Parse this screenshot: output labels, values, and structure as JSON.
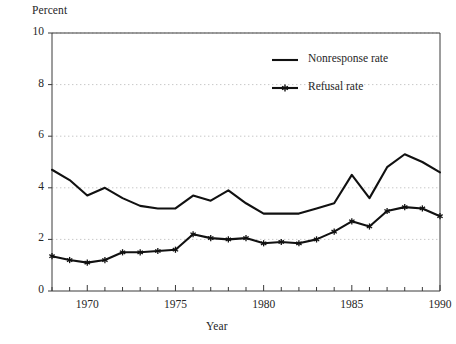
{
  "chart_data": {
    "type": "line",
    "title": "",
    "xlabel": "Year",
    "ylabel": "Percent",
    "ylim": [
      0,
      10
    ],
    "xlim": [
      1968,
      1990
    ],
    "yticks": [
      0,
      2,
      4,
      6,
      8,
      10
    ],
    "ytick_labels": [
      "0",
      "2",
      "4",
      "6",
      "8",
      "10"
    ],
    "xticks": [
      1970,
      1975,
      1980,
      1985,
      1990
    ],
    "xtick_labels": [
      "1970",
      "1975",
      "1980",
      "1985",
      "1990"
    ],
    "minor_xticks_every": 1,
    "grid": "horizontal-dotted",
    "legend_position": "top-center-right",
    "x": [
      1968,
      1969,
      1970,
      1971,
      1972,
      1973,
      1974,
      1975,
      1976,
      1977,
      1978,
      1979,
      1980,
      1981,
      1982,
      1983,
      1984,
      1985,
      1986,
      1987,
      1988,
      1989,
      1990
    ],
    "series": [
      {
        "name": "Nonresponse rate",
        "marker": "none",
        "values": [
          4.7,
          4.3,
          3.7,
          4.0,
          3.6,
          3.3,
          3.2,
          3.2,
          3.7,
          3.5,
          3.9,
          3.4,
          3.0,
          3.0,
          3.0,
          3.2,
          3.4,
          4.5,
          3.6,
          4.8,
          5.3,
          5.0,
          4.6
        ]
      },
      {
        "name": "Refusal rate",
        "marker": "star",
        "values": [
          1.35,
          1.2,
          1.1,
          1.2,
          1.5,
          1.5,
          1.55,
          1.6,
          2.2,
          2.05,
          2.0,
          2.05,
          1.85,
          1.9,
          1.85,
          2.0,
          2.3,
          2.7,
          2.5,
          3.1,
          3.25,
          3.2,
          2.9
        ]
      }
    ]
  },
  "legend": {
    "items": [
      {
        "label": "Nonresponse rate",
        "marker": "plain-line"
      },
      {
        "label": "Refusal rate",
        "marker": "star-line"
      }
    ]
  },
  "colors": {
    "line": "#111111",
    "axis": "#3a3a3a",
    "grid": "#b9b9b9",
    "text": "#262626",
    "background": "#ffffff"
  }
}
